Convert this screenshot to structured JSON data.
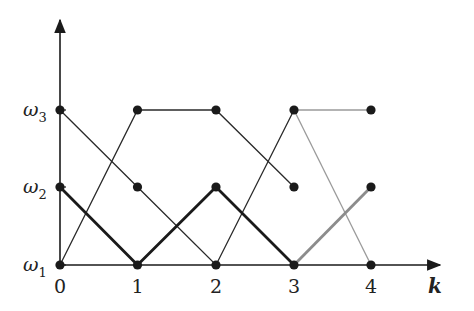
{
  "diagram": {
    "type": "trellis",
    "x_axis": {
      "label": "k",
      "ticks": [
        "0",
        "1",
        "2",
        "3",
        "4"
      ]
    },
    "y_axis": {
      "labels": [
        {
          "symbol": "ω",
          "sub": "1"
        },
        {
          "symbol": "ω",
          "sub": "2"
        },
        {
          "symbol": "ω",
          "sub": "3"
        }
      ]
    },
    "nodes": [
      {
        "k": 0,
        "state": 1
      },
      {
        "k": 0,
        "state": 2
      },
      {
        "k": 0,
        "state": 3
      },
      {
        "k": 1,
        "state": 1
      },
      {
        "k": 1,
        "state": 2
      },
      {
        "k": 1,
        "state": 3
      },
      {
        "k": 2,
        "state": 1
      },
      {
        "k": 2,
        "state": 2
      },
      {
        "k": 2,
        "state": 3
      },
      {
        "k": 3,
        "state": 1
      },
      {
        "k": 3,
        "state": 2
      },
      {
        "k": 3,
        "state": 3
      },
      {
        "k": 4,
        "state": 1
      },
      {
        "k": 4,
        "state": 2
      },
      {
        "k": 4,
        "state": 3
      }
    ],
    "paths": [
      {
        "name": "path-a",
        "style": "thin",
        "color": "#2a2a2a",
        "points": [
          [
            0,
            1
          ],
          [
            1,
            3
          ],
          [
            2,
            3
          ],
          [
            3,
            2
          ]
        ]
      },
      {
        "name": "path-b",
        "style": "thin",
        "color": "#2a2a2a",
        "points": [
          [
            0,
            3
          ],
          [
            1,
            2
          ],
          [
            2,
            1
          ],
          [
            3,
            3
          ]
        ]
      },
      {
        "name": "path-b-branch-1",
        "style": "thin",
        "color": "#9a9a9a",
        "points": [
          [
            3,
            3
          ],
          [
            4,
            3
          ]
        ]
      },
      {
        "name": "path-b-branch-2",
        "style": "thin",
        "color": "#9a9a9a",
        "points": [
          [
            3,
            3
          ],
          [
            4,
            1
          ]
        ]
      },
      {
        "name": "path-c",
        "style": "thick",
        "color": "#1a1a1a",
        "points": [
          [
            0,
            2
          ],
          [
            1,
            1
          ],
          [
            2,
            2
          ],
          [
            3,
            1
          ]
        ]
      },
      {
        "name": "path-c-extension",
        "style": "thick",
        "color": "#8c8c8c",
        "points": [
          [
            3,
            1
          ],
          [
            4,
            2
          ]
        ]
      }
    ]
  }
}
